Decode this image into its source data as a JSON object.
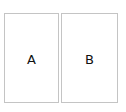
{
  "panels": [
    {
      "id": "a",
      "label": "A"
    },
    {
      "id": "b",
      "label": "B"
    }
  ],
  "colors": {
    "border": "#c4c4c4",
    "background": "#ffffff",
    "text": "#111111"
  }
}
